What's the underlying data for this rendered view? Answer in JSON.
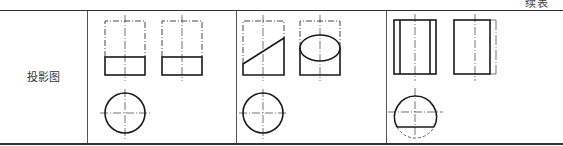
{
  "table": {
    "caption": "续表",
    "row_label": "投影图",
    "columns": [
      {
        "id": "cylinder-cut-horizontal",
        "views": [
          "front-view",
          "side-view",
          "top-view"
        ],
        "description": "Cylinder truncated by horizontal plane: front and side views show lower rectangle with dashed upper outline; top view circle"
      },
      {
        "id": "cylinder-cut-oblique",
        "views": [
          "front-view",
          "side-view",
          "top-view"
        ],
        "description": "Cylinder cut by inclined plane: front view shows slanted line, side view shows ellipse; top view circle"
      },
      {
        "id": "cylinder-cut-vertical",
        "views": [
          "front-view",
          "side-view",
          "top-view"
        ],
        "description": "Cylinder cut by vertical plane: front view with inner vertical lines, side view narrowed rectangle; top view circle with chord flat"
      }
    ]
  },
  "colors": {
    "line": "#1a1a1a",
    "thin_line": "#555555",
    "background": "#ffffff"
  }
}
